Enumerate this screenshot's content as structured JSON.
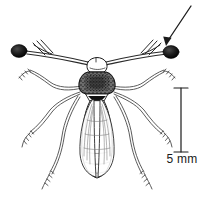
{
  "figure": {
    "background_color": "#ffffff",
    "ink_color": "#1a1a1a",
    "scale_bar": {
      "label": "5 mm",
      "orientation": "vertical",
      "bar_top_y": 88,
      "bar_bottom_y": 152,
      "bar_x": 181
    },
    "annotation_arrow": {
      "name": "eyestalk-pointer-arrow",
      "points_to": "right-eyestalk-eye",
      "tail_x": 191,
      "tail_y": 6,
      "tip_x": 166,
      "tip_y": 45
    },
    "anatomy": [
      {
        "name": "left-eye-bulb",
        "cx": 19,
        "cy": 51
      },
      {
        "name": "right-eye-bulb",
        "cx": 171,
        "cy": 52
      },
      {
        "name": "left-eyestalk",
        "label": "left eye stalk"
      },
      {
        "name": "right-eyestalk",
        "label": "right eye stalk"
      },
      {
        "name": "head",
        "label": "head"
      },
      {
        "name": "thorax",
        "label": "thorax"
      },
      {
        "name": "abdomen",
        "label": "abdomen"
      },
      {
        "name": "wings",
        "label": "folded wings"
      },
      {
        "name": "legs",
        "label": "six legs"
      }
    ]
  }
}
